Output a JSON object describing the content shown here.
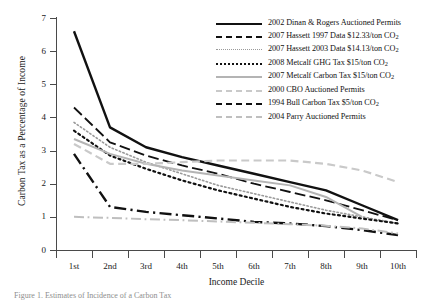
{
  "chart_data": {
    "type": "line",
    "title": "",
    "xlabel": "Income Decile",
    "ylabel": "Carbon Tax as a Percentage of Income",
    "categories": [
      "1st",
      "2nd",
      "3rd",
      "4th",
      "5th",
      "6th",
      "7th",
      "8th",
      "9th",
      "10th"
    ],
    "ylim": [
      0,
      7
    ],
    "yticks": [
      0,
      1,
      2,
      3,
      4,
      5,
      6,
      7
    ],
    "grid": false,
    "legend_position": "top-right",
    "series": [
      {
        "name": "2002 Dinan & Rogers Auctioned Permits",
        "style": "solid",
        "color": "#111111",
        "width": 2.4,
        "values": [
          6.6,
          3.7,
          3.1,
          2.8,
          2.55,
          2.3,
          2.05,
          1.8,
          1.35,
          0.9
        ]
      },
      {
        "name": "2007 Hassett 1997 Data $12.33/ton CO2",
        "style": "long-dash",
        "color": "#111111",
        "width": 1.8,
        "values": [
          4.3,
          3.25,
          2.85,
          2.55,
          2.3,
          2.0,
          1.75,
          1.5,
          1.2,
          0.9
        ]
      },
      {
        "name": "2007 Hassett 2003 Data $14.13/ton CO2",
        "style": "dotted",
        "color": "#9a9a9a",
        "width": 1.6,
        "values": [
          3.85,
          3.1,
          2.65,
          2.3,
          1.95,
          1.7,
          1.45,
          1.2,
          1.0,
          0.8
        ]
      },
      {
        "name": "2008 Metcalf GHG Tax $15/ton CO2",
        "style": "dotted",
        "color": "#111111",
        "width": 2.2,
        "values": [
          3.6,
          2.85,
          2.45,
          2.1,
          1.8,
          1.55,
          1.3,
          1.1,
          0.95,
          0.8
        ]
      },
      {
        "name": "2007 Metcalf Carbon Tax $15/ton CO2",
        "style": "solid",
        "color": "#b4b4b4",
        "width": 2.0,
        "values": [
          3.35,
          2.9,
          2.6,
          2.4,
          2.25,
          2.1,
          1.95,
          1.6,
          1.0,
          null
        ]
      },
      {
        "name": "2000 CBO Auctioned Permits",
        "style": "dashed",
        "color": "#c9c9c9",
        "width": 2.2,
        "values": [
          3.2,
          2.6,
          2.6,
          2.65,
          2.7,
          2.7,
          2.7,
          2.6,
          2.4,
          2.05
        ]
      },
      {
        "name": "1994 Bull Carbon Tax $5/ton CO2",
        "style": "dash-dot",
        "color": "#111111",
        "width": 2.4,
        "values": [
          2.9,
          1.3,
          1.15,
          1.05,
          0.95,
          0.85,
          0.8,
          0.72,
          0.6,
          0.45
        ]
      },
      {
        "name": "2004 Parry Auctioned Permits",
        "style": "dash-dot",
        "color": "#bfbfbf",
        "width": 2.0,
        "values": [
          1.0,
          0.97,
          0.93,
          0.9,
          0.86,
          0.82,
          0.78,
          0.73,
          0.65,
          0.5
        ]
      }
    ]
  },
  "axes": {
    "y_title": "Carbon Tax as a Percentage of Income",
    "x_title": "Income Decile",
    "y_tick_labels": [
      "7",
      "6",
      "5",
      "4",
      "3",
      "2",
      "1",
      "0"
    ],
    "x_tick_labels": [
      "1st",
      "2nd",
      "3rd",
      "4th",
      "5th",
      "6th",
      "7th",
      "8th",
      "9th",
      "10th"
    ]
  },
  "legend": {
    "items": [
      {
        "label_main": "2002 Dinan & Rogers Auctioned Permits",
        "label_sub": "",
        "swatch": "sw-solid-black",
        "swatch_name": "legend-swatch-solid-black"
      },
      {
        "label_main": "2007 Hassett 1997 Data $12.33/ton CO",
        "label_sub": "2",
        "swatch": "sw-longdash-black",
        "swatch_name": "legend-swatch-long-dash-black"
      },
      {
        "label_main": "2007 Hassett 2003 Data $14.13/ton CO",
        "label_sub": "2",
        "swatch": "sw-dot-gray",
        "swatch_name": "legend-swatch-dotted-gray"
      },
      {
        "label_main": "2008 Metcalf GHG Tax $15/ton CO",
        "label_sub": "2",
        "swatch": "sw-dot-black",
        "swatch_name": "legend-swatch-dotted-black"
      },
      {
        "label_main": "2007 Metcalf Carbon Tax $15/ton CO",
        "label_sub": "2",
        "swatch": "sw-solid-gray",
        "swatch_name": "legend-swatch-solid-gray"
      },
      {
        "label_main": "2000 CBO Auctioned Permits",
        "label_sub": "",
        "swatch": "sw-dash-ltgray",
        "swatch_name": "legend-swatch-dashed-light-gray"
      },
      {
        "label_main": "1994 Bull Carbon Tax $5/ton CO",
        "label_sub": "2",
        "swatch": "sw-dashdot-black",
        "swatch_name": "legend-swatch-dash-dot-black"
      },
      {
        "label_main": "2004 Parry Auctioned Permits",
        "label_sub": "",
        "swatch": "sw-dashdot-ltgray",
        "swatch_name": "legend-swatch-dash-dot-light-gray"
      }
    ]
  },
  "caption": {
    "text": "Figure 1. Estimates of Incidence of a Carbon Tax"
  }
}
